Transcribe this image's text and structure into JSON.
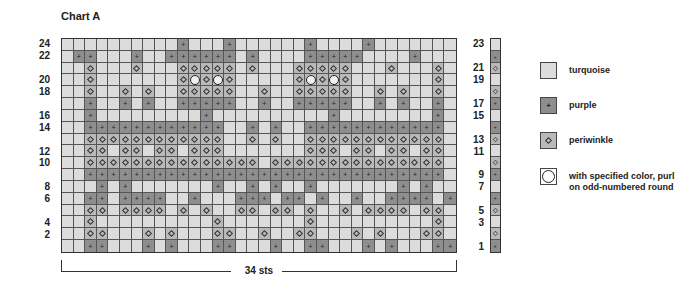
{
  "chart": {
    "title": "Chart A",
    "stitch_count_label": "34 sts",
    "columns": 34,
    "rows": 18,
    "left_row_labels": [
      {
        "row": 1,
        "label": "24"
      },
      {
        "row": 2,
        "label": "22"
      },
      {
        "row": 4,
        "label": "20"
      },
      {
        "row": 5,
        "label": "18"
      },
      {
        "row": 7,
        "label": "16"
      },
      {
        "row": 8,
        "label": "14"
      },
      {
        "row": 10,
        "label": "12"
      },
      {
        "row": 11,
        "label": "10"
      },
      {
        "row": 13,
        "label": "8"
      },
      {
        "row": 14,
        "label": "6"
      },
      {
        "row": 16,
        "label": "4"
      },
      {
        "row": 17,
        "label": "2"
      }
    ],
    "right_row_labels": [
      {
        "row": 1,
        "label": "23"
      },
      {
        "row": 3,
        "label": "21"
      },
      {
        "row": 4,
        "label": "19"
      },
      {
        "row": 6,
        "label": "17"
      },
      {
        "row": 7,
        "label": "15"
      },
      {
        "row": 9,
        "label": "13"
      },
      {
        "row": 10,
        "label": "11"
      },
      {
        "row": 12,
        "label": "9"
      },
      {
        "row": 13,
        "label": "7"
      },
      {
        "row": 15,
        "label": "5"
      },
      {
        "row": 16,
        "label": "3"
      },
      {
        "row": 18,
        "label": "1"
      }
    ],
    "grid_rows": [
      "ttttttttttptttpttttttpttttpttttttttt",
      "tpptttpttpppppptpttttpppppttttptttpp",
      "ttwtttwtttwwwwwtwtttwwwwwtttwtttwt",
      "ttwtttttttwowowtttttwowowtttttttwt",
      "ttwttwtwttwwwwwttwttwwwwwttwtwttwt",
      "ttpttptpttpppppttpttpppppttptpttpt",
      "ttptttttttttpttttttttttpttttttttpt",
      "ttppppppppppppttptpttppppppppppppt",
      "ttwwwwwwwwwwwwttwtwttwwwwwwwwwwwwt",
      "ttwwtwwtwwtwwwtttttttwwwtwwtwwtwwt",
      "ttwwwwwwwwwwwwwwwtwwwwwwwwwwwwwwwt",
      "ttpppppppppppppppppppppppppppppppt",
      "tttptptttttttpttptpttptttttttptpttt",
      "ttpptppppttptttppptpptpttpttpppptppt",
      "ttwwtwwwwtwtwttwwtwwtwttwtwwwwtwwt",
      "ttwttttttttttwtttttttwttttttttttwt",
      "ttwwtttwtwtttwwttwttwwtttwtwtttwwt",
      "ttpptttptptttpptttpttpptttptptttppt"
    ],
    "strip": [
      "t",
      "p",
      "w",
      "t",
      "w",
      "p",
      "t",
      "p",
      "w",
      "t",
      "w",
      "p",
      "t",
      "p",
      "w",
      "t",
      "w",
      "p"
    ]
  },
  "legend": {
    "items": [
      {
        "code": "t",
        "label": "turquoise",
        "symbol": "none"
      },
      {
        "code": "p",
        "label": "purple",
        "symbol": "plus"
      },
      {
        "code": "w",
        "label": "periwinkle",
        "symbol": "diamond"
      },
      {
        "code": "o",
        "label": "with specified color, purl on odd-numbered round",
        "symbol": "circle"
      }
    ]
  },
  "colors": {
    "turquoise": "#dcdcdc",
    "purple": "#8e8e8e",
    "periwinkle": "#b9b9b9"
  }
}
